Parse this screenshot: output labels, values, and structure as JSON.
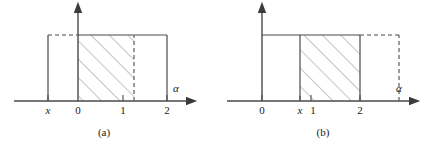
{
  "figure": {
    "panels": [
      {
        "id": "a",
        "caption": "(a)",
        "axis_label": "α",
        "tick_labels": [
          "x",
          "0",
          "1",
          "2"
        ],
        "description": "Rectangle from x to 2 at height 1; hatched region from 0 to about 1.2; dashed top segment from x to 0; dashed vertical at about 1.2"
      },
      {
        "id": "b",
        "caption": "(b)",
        "axis_label": "α",
        "tick_labels": [
          "0",
          "x",
          "1",
          "2"
        ],
        "description": "Rectangle from 0 to about 2.6 at height 1; hatched region from x to 2; dashed top segment from 2 to 2.6 and dashed vertical at 2.6"
      }
    ],
    "colors": {
      "line": "#4a4a4a",
      "hatch": "#8a8a8a",
      "text": "#1a1a1a",
      "background": "#ffffff"
    }
  }
}
